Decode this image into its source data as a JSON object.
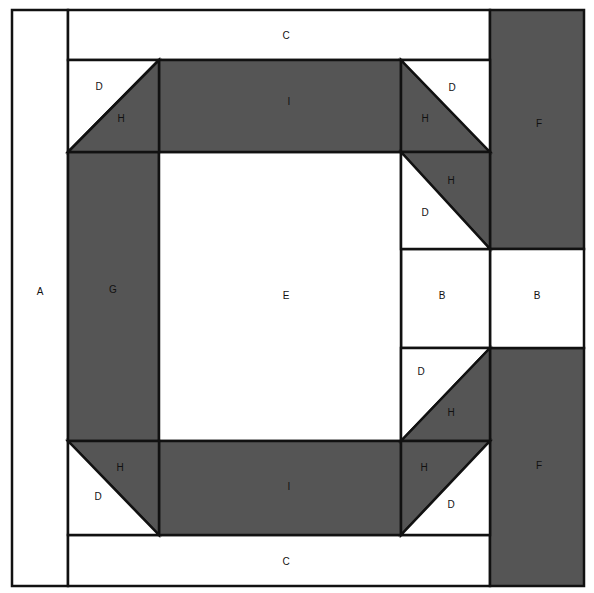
{
  "colors": {
    "dark": "#555555",
    "light": "#ffffff",
    "line": "#111111"
  },
  "pieces": [
    {
      "id": "A",
      "shape": "rect",
      "x": 12,
      "y": 10,
      "w": 56,
      "h": 576,
      "fill": "light",
      "label": "A",
      "lx": 40,
      "ly": 292
    },
    {
      "id": "C-top",
      "shape": "rect",
      "x": 68,
      "y": 10,
      "w": 422,
      "h": 50,
      "fill": "light",
      "label": "C",
      "lx": 286,
      "ly": 36
    },
    {
      "id": "C-bottom",
      "shape": "rect",
      "x": 68,
      "y": 535,
      "w": 422,
      "h": 51,
      "fill": "light",
      "label": "C",
      "lx": 286,
      "ly": 562
    },
    {
      "id": "F-top",
      "shape": "rect",
      "x": 490,
      "y": 10,
      "w": 94,
      "h": 239,
      "fill": "dark",
      "label": "F",
      "lx": 539,
      "ly": 124
    },
    {
      "id": "F-bottom",
      "shape": "rect",
      "x": 490,
      "y": 348,
      "w": 94,
      "h": 238,
      "fill": "dark",
      "label": "F",
      "lx": 539,
      "ly": 466
    },
    {
      "id": "B-right",
      "shape": "rect",
      "x": 490,
      "y": 249,
      "w": 94,
      "h": 99,
      "fill": "light",
      "label": "B",
      "lx": 537,
      "ly": 296
    },
    {
      "id": "B-mid",
      "shape": "rect",
      "x": 401,
      "y": 249,
      "w": 89,
      "h": 99,
      "fill": "light",
      "label": "B",
      "lx": 442,
      "ly": 296
    },
    {
      "id": "G",
      "shape": "rect",
      "x": 68,
      "y": 152,
      "w": 91,
      "h": 289,
      "fill": "dark",
      "label": "G",
      "lx": 113,
      "ly": 290
    },
    {
      "id": "E",
      "shape": "rect",
      "x": 159,
      "y": 152,
      "w": 242,
      "h": 289,
      "fill": "light",
      "label": "E",
      "lx": 286,
      "ly": 296
    },
    {
      "id": "I-top",
      "shape": "rect",
      "x": 159,
      "y": 60,
      "w": 242,
      "h": 92,
      "fill": "dark",
      "label": "I",
      "lx": 289,
      "ly": 102
    },
    {
      "id": "I-bottom",
      "shape": "rect",
      "x": 159,
      "y": 441,
      "w": 242,
      "h": 94,
      "fill": "dark",
      "label": "I",
      "lx": 289,
      "ly": 487
    },
    {
      "id": "D-tl",
      "shape": "poly",
      "points": "68,60 159,60 68,152",
      "fill": "light",
      "label": "D",
      "lx": 99,
      "ly": 87
    },
    {
      "id": "H-tl",
      "shape": "poly",
      "points": "159,60 159,152 68,152",
      "fill": "dark",
      "label": "H",
      "lx": 121,
      "ly": 119
    },
    {
      "id": "H-tr",
      "shape": "poly",
      "points": "401,60 490,152 401,152",
      "fill": "dark",
      "label": "H",
      "lx": 425,
      "ly": 119
    },
    {
      "id": "D-tr",
      "shape": "poly",
      "points": "401,60 490,60 490,152",
      "fill": "light",
      "label": "D",
      "lx": 452,
      "ly": 88
    },
    {
      "id": "H-r1",
      "shape": "poly",
      "points": "401,152 490,152 490,249",
      "fill": "dark",
      "label": "H",
      "lx": 451,
      "ly": 181
    },
    {
      "id": "D-r1",
      "shape": "poly",
      "points": "401,152 490,249 401,249",
      "fill": "light",
      "label": "D",
      "lx": 425,
      "ly": 213
    },
    {
      "id": "D-r2",
      "shape": "poly",
      "points": "401,348 490,348 401,441",
      "fill": "light",
      "label": "D",
      "lx": 421,
      "ly": 372
    },
    {
      "id": "H-r2",
      "shape": "poly",
      "points": "490,348 490,441 401,441",
      "fill": "dark",
      "label": "H",
      "lx": 451,
      "ly": 413
    },
    {
      "id": "H-br",
      "shape": "poly",
      "points": "401,441 490,441 401,535",
      "fill": "dark",
      "label": "H",
      "lx": 424,
      "ly": 468
    },
    {
      "id": "D-br",
      "shape": "poly",
      "points": "490,441 490,535 401,535",
      "fill": "light",
      "label": "D",
      "lx": 451,
      "ly": 505
    },
    {
      "id": "H-bl",
      "shape": "poly",
      "points": "68,441 159,441 159,535",
      "fill": "dark",
      "label": "H",
      "lx": 120,
      "ly": 468
    },
    {
      "id": "D-bl",
      "shape": "poly",
      "points": "68,441 159,535 68,535",
      "fill": "light",
      "label": "D",
      "lx": 98,
      "ly": 497
    }
  ]
}
